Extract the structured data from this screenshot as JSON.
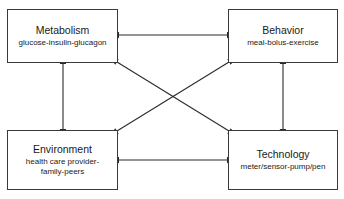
{
  "diagram": {
    "type": "conceptual-block-diagram",
    "background_color": "#ffffff",
    "stroke_color": "#3a3a3a",
    "text_color": "#1a1a1a",
    "nodes": [
      {
        "id": "metabolism",
        "title": "Metabolism",
        "subtitle": "glucose-insulin-glucagon",
        "position": "top-left"
      },
      {
        "id": "behavior",
        "title": "Behavior",
        "subtitle": "meal-bolus-exercise",
        "position": "top-right"
      },
      {
        "id": "environment",
        "title": "Environment",
        "subtitle": "health care provider-\nfamily-peers",
        "position": "bottom-left"
      },
      {
        "id": "technology",
        "title": "Technology",
        "subtitle": "meter/sensor-pump/pen",
        "position": "bottom-right"
      }
    ],
    "connectors": [
      {
        "id": "metabolism-behavior",
        "from": "metabolism",
        "to": "behavior",
        "style": "double-headed-arrow",
        "orientation": "horizontal-top"
      },
      {
        "id": "environment-technology",
        "from": "environment",
        "to": "technology",
        "style": "double-headed-arrow",
        "orientation": "horizontal-bottom"
      },
      {
        "id": "metabolism-environment",
        "from": "metabolism",
        "to": "environment",
        "style": "double-headed-arrow",
        "orientation": "vertical-left"
      },
      {
        "id": "behavior-technology",
        "from": "behavior",
        "to": "technology",
        "style": "double-headed-arrow",
        "orientation": "vertical-right"
      },
      {
        "id": "metabolism-technology",
        "from": "metabolism",
        "to": "technology",
        "style": "double-headed-arrow",
        "orientation": "diagonal"
      },
      {
        "id": "behavior-environment",
        "from": "behavior",
        "to": "environment",
        "style": "double-headed-arrow",
        "orientation": "diagonal"
      }
    ]
  }
}
